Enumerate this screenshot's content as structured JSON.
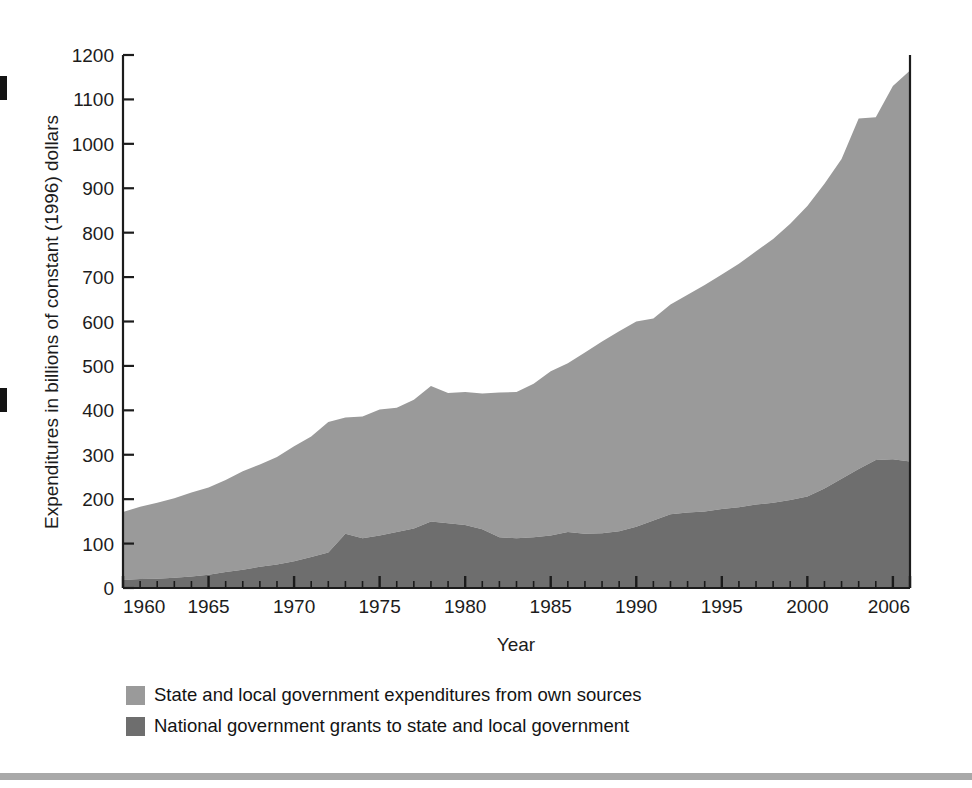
{
  "figure": {
    "background_color": "#ffffff",
    "footer_rule_color": "#a9a9a9"
  },
  "axes": {
    "y_title": "Expenditures in billions of constant (1996) dollars",
    "x_title": "Year",
    "y_ticks": [
      "0",
      "100",
      "200",
      "300",
      "400",
      "500",
      "600",
      "700",
      "800",
      "900",
      "1000",
      "1100",
      "1200"
    ],
    "x_ticks": [
      "1960",
      "1965",
      "1970",
      "1975",
      "1980",
      "1985",
      "1990",
      "1995",
      "2000",
      "2006"
    ],
    "axis_color": "#1c1c1c"
  },
  "legend": {
    "items": [
      {
        "label": "State and local government expenditures from own sources",
        "color": "#9a9a9a"
      },
      {
        "label": "National government grants to state and local government",
        "color": "#6e6e6e"
      }
    ]
  },
  "chart_data": {
    "type": "area",
    "stacked": true,
    "title": "",
    "xlabel": "Year",
    "ylabel": "Expenditures in billions of constant (1996) dollars",
    "xlim": [
      1960,
      2006
    ],
    "ylim": [
      0,
      1200
    ],
    "ytick_step": 100,
    "xtick_major_step": 5,
    "xtick_minor_step": 1,
    "grid": false,
    "legend_position": "below-plot-left",
    "x": [
      1960,
      1961,
      1962,
      1963,
      1964,
      1965,
      1966,
      1967,
      1968,
      1969,
      1970,
      1971,
      1972,
      1973,
      1974,
      1975,
      1976,
      1977,
      1978,
      1979,
      1980,
      1981,
      1982,
      1983,
      1984,
      1985,
      1986,
      1987,
      1988,
      1989,
      1990,
      1991,
      1992,
      1993,
      1994,
      1995,
      1996,
      1997,
      1998,
      1999,
      2000,
      2001,
      2002,
      2003,
      2004,
      2005,
      2006
    ],
    "series": [
      {
        "name": "National government grants to state and local government",
        "color": "#6e6e6e",
        "values": [
          18,
          20,
          21,
          23,
          26,
          30,
          36,
          41,
          48,
          53,
          60,
          70,
          80,
          122,
          112,
          118,
          126,
          134,
          150,
          146,
          142,
          132,
          114,
          112,
          114,
          118,
          126,
          122,
          123,
          128,
          138,
          152,
          166,
          170,
          172,
          178,
          182,
          188,
          192,
          198,
          206,
          224,
          246,
          268,
          288,
          290,
          285
        ]
      },
      {
        "name": "State and local government expenditures from own sources",
        "color": "#9a9a9a",
        "values": [
          153,
          163,
          171,
          179,
          189,
          196,
          207,
          222,
          230,
          242,
          259,
          271,
          294,
          262,
          274,
          284,
          280,
          290,
          305,
          293,
          299,
          306,
          326,
          329,
          346,
          370,
          380,
          408,
          432,
          450,
          462,
          455,
          472,
          490,
          510,
          528,
          548,
          570,
          594,
          622,
          654,
          686,
          720,
          789,
          772,
          840,
          880
        ]
      }
    ],
    "totals": [
      171,
      183,
      192,
      202,
      215,
      226,
      243,
      263,
      278,
      295,
      319,
      341,
      374,
      384,
      386,
      402,
      406,
      424,
      455,
      439,
      441,
      438,
      440,
      441,
      460,
      488,
      506,
      530,
      555,
      578,
      600,
      607,
      638,
      660,
      682,
      706,
      730,
      758,
      786,
      820,
      860,
      910,
      966,
      1057,
      1060,
      1130,
      1165
    ]
  },
  "geometry": {
    "plot_left": 123,
    "plot_right": 910,
    "plot_top": 55,
    "plot_bottom": 588
  }
}
